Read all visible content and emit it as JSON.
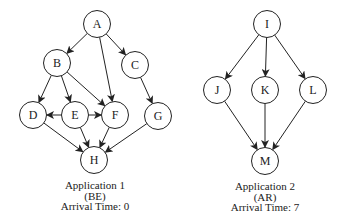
{
  "colors": {
    "stroke": "#222222",
    "fill": "#ffffff",
    "text": "#222222"
  },
  "node_radius": 13.5,
  "graphs": [
    {
      "id": "app1",
      "caption": {
        "title": "Application 1",
        "type": "(BE)",
        "arrival": "Arrival Time: 0",
        "cx": 95,
        "y": 180
      },
      "nodes": [
        {
          "id": "A",
          "label": "A",
          "x": 97,
          "y": 24
        },
        {
          "id": "B",
          "label": "B",
          "x": 57,
          "y": 63
        },
        {
          "id": "C",
          "label": "C",
          "x": 135,
          "y": 65
        },
        {
          "id": "D",
          "label": "D",
          "x": 33,
          "y": 115
        },
        {
          "id": "E",
          "label": "E",
          "x": 75,
          "y": 115
        },
        {
          "id": "F",
          "label": "F",
          "x": 115,
          "y": 115
        },
        {
          "id": "G",
          "label": "G",
          "x": 158,
          "y": 116
        },
        {
          "id": "H",
          "label": "H",
          "x": 94,
          "y": 160
        }
      ],
      "edges": [
        [
          "A",
          "B"
        ],
        [
          "A",
          "C"
        ],
        [
          "A",
          "F"
        ],
        [
          "B",
          "D"
        ],
        [
          "B",
          "E"
        ],
        [
          "B",
          "F"
        ],
        [
          "C",
          "G"
        ],
        [
          "E",
          "D"
        ],
        [
          "E",
          "F"
        ],
        [
          "D",
          "H"
        ],
        [
          "E",
          "H"
        ],
        [
          "F",
          "H"
        ],
        [
          "G",
          "H"
        ]
      ]
    },
    {
      "id": "app2",
      "caption": {
        "title": "Application 2",
        "type": "(AR)",
        "arrival": "Arrival Time: 7",
        "cx": 265,
        "y": 181
      },
      "nodes": [
        {
          "id": "I",
          "label": "I",
          "x": 267,
          "y": 24
        },
        {
          "id": "J",
          "label": "J",
          "x": 217,
          "y": 90
        },
        {
          "id": "K",
          "label": "K",
          "x": 265,
          "y": 90
        },
        {
          "id": "L",
          "label": "L",
          "x": 313,
          "y": 90
        },
        {
          "id": "M",
          "label": "M",
          "x": 265,
          "y": 161
        }
      ],
      "edges": [
        [
          "I",
          "J"
        ],
        [
          "I",
          "K"
        ],
        [
          "I",
          "L"
        ],
        [
          "J",
          "M"
        ],
        [
          "K",
          "M"
        ],
        [
          "L",
          "M"
        ]
      ]
    }
  ]
}
